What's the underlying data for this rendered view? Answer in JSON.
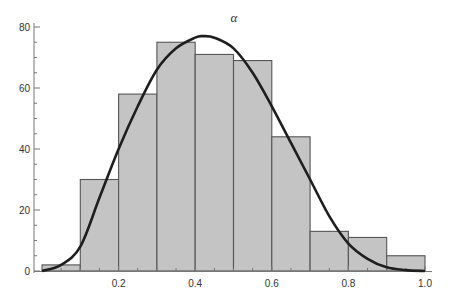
{
  "chart_data": {
    "type": "bar",
    "subtype": "histogram-with-density-curve",
    "title": "α",
    "xlabel": "",
    "ylabel": "",
    "xlim": [
      0.0,
      1.0
    ],
    "ylim": [
      0,
      80
    ],
    "x_ticks": [
      0.2,
      0.4,
      0.6,
      0.8,
      1.0
    ],
    "x_tick_labels": [
      "0.2",
      "0.4",
      "0.6",
      "0.8",
      "1.0"
    ],
    "y_ticks": [
      0,
      20,
      40,
      60,
      80
    ],
    "y_tick_labels": [
      "0",
      "20",
      "40",
      "60",
      "80"
    ],
    "grid": false,
    "bins": [
      {
        "start": 0.0,
        "end": 0.1,
        "count": 2
      },
      {
        "start": 0.1,
        "end": 0.2,
        "count": 30
      },
      {
        "start": 0.2,
        "end": 0.3,
        "count": 58
      },
      {
        "start": 0.3,
        "end": 0.4,
        "count": 75
      },
      {
        "start": 0.4,
        "end": 0.5,
        "count": 71
      },
      {
        "start": 0.5,
        "end": 0.6,
        "count": 69
      },
      {
        "start": 0.6,
        "end": 0.7,
        "count": 44
      },
      {
        "start": 0.7,
        "end": 0.8,
        "count": 13
      },
      {
        "start": 0.8,
        "end": 0.9,
        "count": 11
      },
      {
        "start": 0.9,
        "end": 1.0,
        "count": 5
      }
    ],
    "density_curve": {
      "description": "smooth fitted density, peak near x=0.42",
      "x": [
        0.0,
        0.05,
        0.1,
        0.15,
        0.2,
        0.25,
        0.3,
        0.35,
        0.4,
        0.42,
        0.45,
        0.5,
        0.55,
        0.6,
        0.65,
        0.7,
        0.75,
        0.8,
        0.85,
        0.9,
        0.95,
        1.0
      ],
      "y": [
        0,
        2,
        8,
        24,
        40,
        54,
        66,
        73,
        76.5,
        77,
        76.5,
        73,
        65,
        54,
        42,
        30,
        18,
        9,
        4,
        1.2,
        0.3,
        0
      ]
    },
    "colors": {
      "bar_fill": "#c4c4c4",
      "bar_edge": "#555555",
      "curve": "#1e1e1e"
    }
  }
}
